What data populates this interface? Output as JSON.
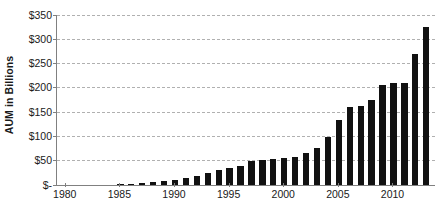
{
  "chart_data": {
    "type": "bar",
    "title": "",
    "subtitle": "",
    "xlabel": "",
    "ylabel": "AUM in Billions",
    "ylim": [
      0,
      350
    ],
    "ytick_values": [
      0,
      50,
      100,
      150,
      200,
      250,
      300,
      350
    ],
    "ytick_labels": [
      "$-",
      "$50",
      "$100",
      "$150",
      "$200",
      "$250",
      "$300",
      "$350"
    ],
    "xtick_labels": [
      "1980",
      "1985",
      "1990",
      "1995",
      "2000",
      "2005",
      "2010"
    ],
    "xtick_values": [
      1980,
      1985,
      1990,
      1995,
      2000,
      2005,
      2010
    ],
    "xlim": [
      1979.2,
      2013.8
    ],
    "grid": true,
    "grid_axis": "y",
    "grid_style": "dashed",
    "legend": false,
    "bar_color": "#111111",
    "axis_color": "#808080",
    "grid_color": "#b0b0b0",
    "text_color": "#1a1a1a",
    "categories": [
      1980,
      1981,
      1982,
      1983,
      1984,
      1985,
      1986,
      1987,
      1988,
      1989,
      1990,
      1991,
      1992,
      1993,
      1994,
      1995,
      1996,
      1997,
      1998,
      1999,
      2000,
      2001,
      2002,
      2003,
      2004,
      2005,
      2006,
      2007,
      2008,
      2009,
      2010,
      2011,
      2012,
      2013
    ],
    "values": [
      0,
      0,
      0,
      0,
      0,
      1,
      2,
      3,
      5,
      7,
      10,
      14,
      18,
      24,
      30,
      34,
      38,
      48,
      50,
      52,
      54,
      57,
      64,
      76,
      97,
      133,
      160,
      162,
      173,
      205,
      210,
      208,
      268,
      325
    ],
    "annotations": []
  },
  "axis": {
    "y_title": "AUM in Billions"
  }
}
